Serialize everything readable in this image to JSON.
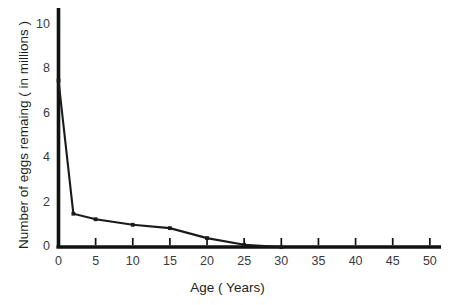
{
  "chart_data": {
    "type": "line",
    "title": "",
    "subtitle": "",
    "xlabel": "Age ( Years)",
    "ylabel": "Number of eggs remaing ( in millions )",
    "x": [
      0,
      2,
      5,
      10,
      15,
      20,
      25,
      30
    ],
    "values": [
      7.5,
      1.5,
      1.25,
      1.0,
      0.85,
      0.4,
      0.1,
      0.0
    ],
    "series": [
      {
        "name": "Eggs remaining",
        "x": [
          0,
          2,
          5,
          10,
          15,
          20,
          25,
          30
        ],
        "values": [
          7.5,
          1.5,
          1.25,
          1.0,
          0.85,
          0.4,
          0.1,
          0.0
        ]
      }
    ],
    "xlim": [
      0,
      51.5
    ],
    "ylim": [
      0,
      10.6
    ],
    "xticks": [
      0,
      5,
      10,
      15,
      20,
      25,
      30,
      35,
      40,
      45,
      50
    ],
    "xtick_labels": [
      "0",
      "5",
      "10",
      "15",
      "20",
      "25",
      "30",
      "35",
      "40",
      "45",
      "50"
    ],
    "yticks": [
      0,
      2,
      4,
      6,
      8,
      10
    ],
    "ytick_labels": [
      "0",
      "2",
      "4",
      "6",
      "8",
      "10"
    ],
    "grid": false,
    "legend": false,
    "legend_position": "none",
    "markers": true,
    "line_color": "#1a1a1a",
    "axis_color": "#111111",
    "background_color": "#ffffff",
    "annotations": []
  },
  "axes": {
    "x_title": "Age ( Years)",
    "y_title": "Number of eggs remaing ( in millions )"
  }
}
